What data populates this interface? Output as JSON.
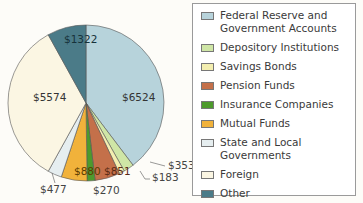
{
  "chart_data": {
    "type": "pie",
    "title": "",
    "start_angle_deg": 0,
    "direction": "clockwise",
    "slices": [
      {
        "label": "Federal Reserve and Government Accounts",
        "value": 6524,
        "display": "$6524",
        "color": "#b7d3db"
      },
      {
        "label": "Depository Institutions",
        "value": 353,
        "display": "$353",
        "color": "#cfe6a6"
      },
      {
        "label": "Savings Bonds",
        "value": 183,
        "display": "$183",
        "color": "#f3eeb0"
      },
      {
        "label": "Pension Funds",
        "value": 851,
        "display": "$851",
        "color": "#c4704a"
      },
      {
        "label": "Insurance Companies",
        "value": 270,
        "display": "$270",
        "color": "#4d9a2c"
      },
      {
        "label": "Mutual Funds",
        "value": 880,
        "display": "$880",
        "color": "#f1b23b"
      },
      {
        "label": "State and Local Governments",
        "value": 477,
        "display": "$477",
        "color": "#e6eef0"
      },
      {
        "label": "Foreign",
        "value": 5574,
        "display": "$5574",
        "color": "#fbf6e3"
      },
      {
        "label": "Other",
        "value": 1322,
        "display": "$1322",
        "color": "#4b7b88"
      }
    ],
    "legend_position": "right"
  },
  "legend": {
    "items": [
      {
        "label": "Federal Reserve and Government Accounts",
        "color": "#b7d3db"
      },
      {
        "label": "Depository Institutions",
        "color": "#cfe6a6"
      },
      {
        "label": "Savings Bonds",
        "color": "#f3eeb0"
      },
      {
        "label": "Pension Funds",
        "color": "#c4704a"
      },
      {
        "label": "Insurance Companies",
        "color": "#4d9a2c"
      },
      {
        "label": "Mutual Funds",
        "color": "#f1b23b"
      },
      {
        "label": "State and Local Governments",
        "color": "#e6eef0"
      },
      {
        "label": "Foreign",
        "color": "#fbf6e3"
      },
      {
        "label": "Other",
        "color": "#4b7b88"
      }
    ]
  }
}
